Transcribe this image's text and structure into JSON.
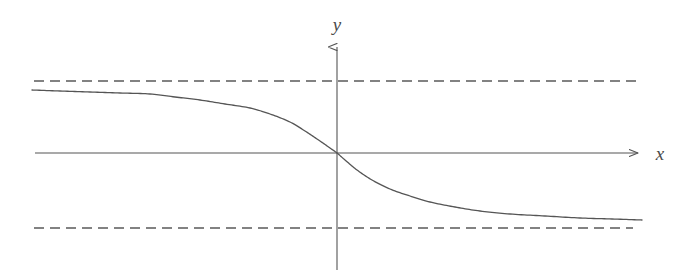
{
  "figure": {
    "title": "",
    "background_color": "#ffffff",
    "width": 697,
    "height": 279,
    "stroke_color": "#555555",
    "dash_color": "#5a5a5a",
    "label_color": "#4a4a4a"
  },
  "axes": {
    "x_axis": {
      "label": "x",
      "label_x": 660,
      "label_y": 160,
      "y": 153,
      "x_start": 35,
      "x_end": 640,
      "arrow": "right"
    },
    "y_axis": {
      "label": "y",
      "label_x": 337,
      "label_y": 31,
      "x": 337,
      "y_start": 270,
      "y_end": 45,
      "arrow": "up"
    }
  },
  "asymptotes": [
    {
      "name": "upper-asymptote",
      "style": "dashed",
      "y": 81,
      "x_start": 34,
      "x_end": 636,
      "dash_length": 10,
      "gap_length": 6
    },
    {
      "name": "lower-asymptote",
      "style": "dashed",
      "y": 228,
      "x_start": 34,
      "x_end": 633,
      "dash_length": 10,
      "gap_length": 6
    }
  ],
  "chart_data": {
    "type": "line",
    "title": "",
    "xlabel": "x",
    "ylabel": "y",
    "grid": false,
    "legend": null,
    "origin_px": [
      337,
      153
    ],
    "xlim_px": [
      32,
      642
    ],
    "ylim_px": [
      81,
      228
    ],
    "asymptote_values_px": [
      81,
      228
    ],
    "series": [
      {
        "name": "curve",
        "style": "solid",
        "points_px": [
          [
            32,
            90
          ],
          [
            60,
            91
          ],
          [
            90,
            92
          ],
          [
            120,
            93
          ],
          [
            150,
            94
          ],
          [
            175,
            97
          ],
          [
            200,
            100
          ],
          [
            225,
            104
          ],
          [
            250,
            108
          ],
          [
            270,
            114
          ],
          [
            290,
            122
          ],
          [
            305,
            131
          ],
          [
            320,
            141
          ],
          [
            330,
            148
          ],
          [
            337,
            153
          ],
          [
            345,
            160
          ],
          [
            357,
            170
          ],
          [
            372,
            180
          ],
          [
            390,
            189
          ],
          [
            410,
            196
          ],
          [
            430,
            202
          ],
          [
            455,
            207
          ],
          [
            480,
            211
          ],
          [
            510,
            214
          ],
          [
            545,
            216
          ],
          [
            580,
            218
          ],
          [
            612,
            219
          ],
          [
            642,
            220
          ]
        ]
      }
    ]
  }
}
